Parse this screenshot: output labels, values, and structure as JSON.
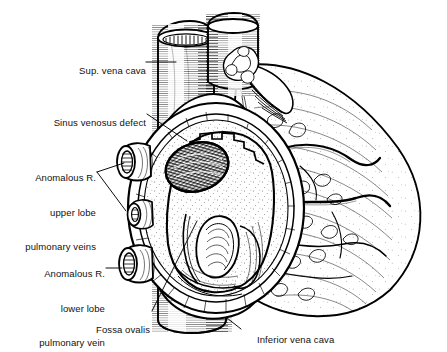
{
  "figure": {
    "style": "black-and-white pen-and-ink line illustration",
    "background_color": "#ffffff",
    "ink_color": "#000000"
  },
  "labels": [
    {
      "id": "sup-vena-cava",
      "text": "Sup. vena cava",
      "lines": [
        "Sup. vena cava"
      ],
      "align": "right",
      "x": 62,
      "y": 53,
      "leader": {
        "type": "line",
        "points": [
          [
            146,
            62
          ],
          [
            176,
            62
          ]
        ]
      }
    },
    {
      "id": "sinus-venosus-defect",
      "text": "Sinus venosus defect",
      "lines": [
        "Sinus venosus defect"
      ],
      "align": "right",
      "x": 44,
      "y": 105,
      "leader": {
        "type": "line",
        "points": [
          [
            147,
            114
          ],
          [
            186,
            140
          ]
        ]
      }
    },
    {
      "id": "anomalous-upper-lobe-veins",
      "text": "Anomalous R. upper lobe pulmonary veins",
      "lines": [
        "Anomalous R.",
        "upper lobe",
        "pulmonary veins"
      ],
      "align": "right",
      "x": 18,
      "y": 149,
      "leader": {
        "type": "bracket",
        "points": [
          [
            97,
            172
          ],
          [
            123,
            163
          ],
          [
            97,
            172
          ],
          [
            124,
            212
          ]
        ]
      }
    },
    {
      "id": "anomalous-lower-lobe-vein",
      "text": "Anomalous R. lower lobe pulmonary vein",
      "lines": [
        "Anomalous R.",
        "lower lobe",
        "pulmonary vein"
      ],
      "align": "right",
      "x": 38,
      "y": 245,
      "leader": {
        "type": "line",
        "points": [
          [
            106,
            268
          ],
          [
            124,
            268
          ]
        ]
      }
    },
    {
      "id": "fossa-ovalis",
      "text": "Fossa ovalis",
      "lines": [
        "Fossa ovalis"
      ],
      "align": "right",
      "x": 88,
      "y": 312,
      "leader": {
        "type": "line",
        "points": [
          [
            152,
            312
          ],
          [
            196,
            221
          ]
        ]
      }
    },
    {
      "id": "inferior-vena-cava",
      "text": "Inferior vena cava",
      "lines": [
        "Inferior vena cava"
      ],
      "align": "left",
      "x": 245,
      "y": 324,
      "leader": {
        "type": "line",
        "points": [
          [
            240,
            329
          ],
          [
            226,
            318
          ]
        ]
      }
    }
  ],
  "anatomy": {
    "structures": [
      "superior vena cava",
      "aorta",
      "right atrium (opened)",
      "sinus venosus defect",
      "fossa ovalis",
      "anomalous right upper lobe pulmonary veins",
      "anomalous right lower lobe pulmonary vein",
      "inferior vena cava",
      "right ventricle",
      "epicardial fat and coronary vessels"
    ]
  }
}
